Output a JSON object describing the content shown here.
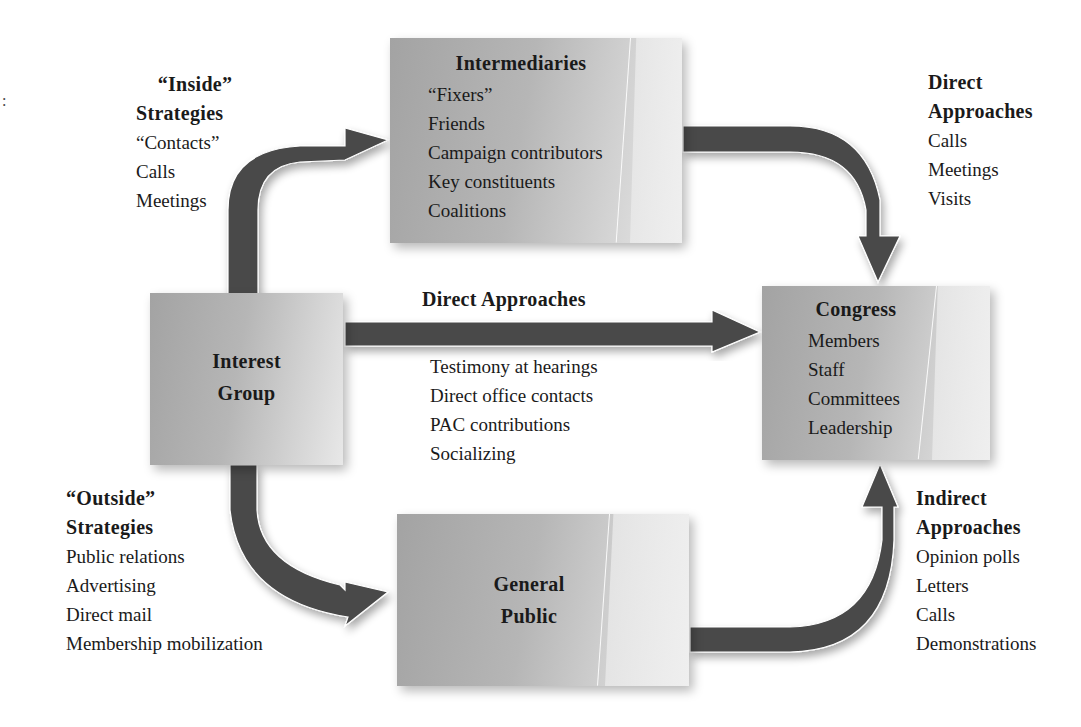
{
  "diagram": {
    "stray_mark": ":",
    "colors": {
      "arrow": "#4a4a4a",
      "box_dark": "#a3a3a3",
      "box_light": "#e8e8e8",
      "text": "#1a1a1a"
    },
    "nodes": {
      "intermediaries": {
        "title": "Intermediaries",
        "items": [
          "“Fixers”",
          "Friends",
          "Campaign contributors",
          "Key constituents",
          "Coalitions"
        ]
      },
      "interest_group": {
        "title_line1": "Interest",
        "title_line2": "Group"
      },
      "congress": {
        "title": "Congress",
        "items": [
          "Members",
          "Staff",
          "Committees",
          "Leadership"
        ]
      },
      "general_public": {
        "title_line1": "General",
        "title_line2": "Public"
      }
    },
    "labels": {
      "inside_strategies": {
        "head_line1": "“Inside”",
        "head_line2": "Strategies",
        "items": [
          "“Contacts”",
          "Calls",
          "Meetings"
        ]
      },
      "direct_approaches_top": {
        "head_line1": "Direct",
        "head_line2": "Approaches",
        "items": [
          "Calls",
          "Meetings",
          "Visits"
        ]
      },
      "direct_approaches_middle": {
        "head": "Direct Approaches",
        "items": [
          "Testimony at hearings",
          "Direct office contacts",
          "PAC contributions",
          "Socializing"
        ]
      },
      "outside_strategies": {
        "head_line1": "“Outside”",
        "head_line2": "Strategies",
        "items": [
          "Public relations",
          "Advertising",
          "Direct mail",
          "Membership mobilization"
        ]
      },
      "indirect_approaches": {
        "head_line1": "Indirect",
        "head_line2": "Approaches",
        "items": [
          "Opinion polls",
          "Letters",
          "Calls",
          "Demonstrations"
        ]
      }
    },
    "edges": [
      {
        "from": "Interest Group",
        "to": "Intermediaries",
        "label": "“Inside” Strategies"
      },
      {
        "from": "Intermediaries",
        "to": "Congress",
        "label": "Direct Approaches"
      },
      {
        "from": "Interest Group",
        "to": "Congress",
        "label": "Direct Approaches"
      },
      {
        "from": "Interest Group",
        "to": "General Public",
        "label": "“Outside” Strategies"
      },
      {
        "from": "General Public",
        "to": "Congress",
        "label": "Indirect Approaches"
      }
    ]
  }
}
